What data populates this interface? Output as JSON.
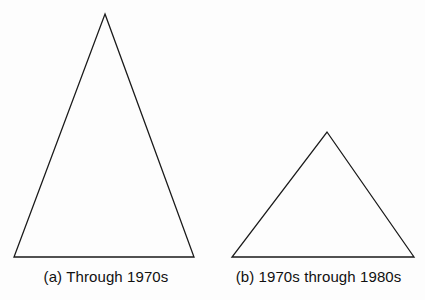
{
  "figure": {
    "type": "line-diagram",
    "background_color": "#fdfdfd",
    "stroke_color": "#1a1a1a",
    "stroke_width": 1.3,
    "text_color": "#111111",
    "width": 425,
    "height": 300
  },
  "panels": [
    {
      "id": "a",
      "caption": "(a) Through 1970s",
      "shape": "triangle",
      "shape_name": "tall-triangle",
      "points": "105,14 194,257 14,257",
      "apex": {
        "x": 105,
        "y": 14
      },
      "base_left": {
        "x": 14,
        "y": 257
      },
      "base_right": {
        "x": 194,
        "y": 257
      },
      "base_width": 180,
      "height": 243
    },
    {
      "id": "b",
      "caption": "(b) 1970s through 1980s",
      "shape": "triangle",
      "shape_name": "short-triangle",
      "points": "327,132 414,257 232,257",
      "apex": {
        "x": 327,
        "y": 132
      },
      "base_left": {
        "x": 232,
        "y": 257
      },
      "base_right": {
        "x": 414,
        "y": 257
      },
      "base_width": 182,
      "height": 125
    }
  ],
  "chart_data": {
    "type": "bar",
    "title": "",
    "xlabel": "",
    "ylabel": "",
    "categories": [
      "(a) Through 1970s",
      "(b) 1970s through 1980s"
    ],
    "values": [
      243,
      125
    ],
    "note": "Two outline triangles of equal base width but differing heights; relative height ratio approximately 1.94 : 1"
  }
}
